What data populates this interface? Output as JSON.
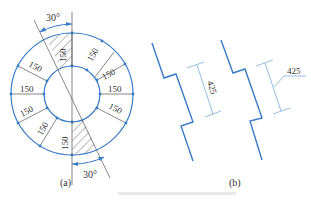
{
  "figure": {
    "colors": {
      "line": "#3a7bc8",
      "text": "#333333",
      "hatch": "#555555"
    },
    "panel_a": {
      "label": "(a)",
      "angle_top": "30°",
      "angle_bottom": "30°",
      "segment_dims": [
        "150",
        "150",
        "150",
        "150",
        "150",
        "150",
        "150",
        "150",
        "150",
        "150"
      ]
    },
    "panel_b": {
      "label": "(b)",
      "dim_left": "425",
      "dim_right": "425"
    }
  }
}
